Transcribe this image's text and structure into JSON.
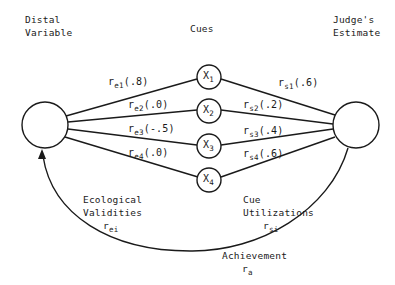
{
  "headers": {
    "distal": [
      "Distal",
      "Variable"
    ],
    "cues": "Cues",
    "judge": [
      "Judge's",
      "Estimate"
    ]
  },
  "cues": [
    {
      "name": "X",
      "sub": "1"
    },
    {
      "name": "X",
      "sub": "2"
    },
    {
      "name": "X",
      "sub": "3"
    },
    {
      "name": "X",
      "sub": "4"
    }
  ],
  "ecological_edges": [
    {
      "r": "r",
      "sub": "e1",
      "value": "(.8)"
    },
    {
      "r": "r",
      "sub": "e2",
      "value": "(.0)"
    },
    {
      "r": "r",
      "sub": "e3",
      "value": "(-.5)"
    },
    {
      "r": "r",
      "sub": "e4",
      "value": "(.0)"
    }
  ],
  "utilization_edges": [
    {
      "r": "r",
      "sub": "s1",
      "value": "(.6)"
    },
    {
      "r": "r",
      "sub": "s2",
      "value": "(.2)"
    },
    {
      "r": "r",
      "sub": "s3",
      "value": "(.4)"
    },
    {
      "r": "r",
      "sub": "s4",
      "value": "(.6)"
    }
  ],
  "ecological_validities": {
    "line1": "Ecological",
    "line2": "Validities",
    "r": "r",
    "sub": "ei"
  },
  "cue_utilizations": {
    "line1": "Cue",
    "line2": "Utilizations",
    "r": "r",
    "sub": "si"
  },
  "achievement": {
    "label": "Achievement",
    "r": "r",
    "sub": "a"
  },
  "colors": {
    "stroke": "#1a1a1a",
    "background": "#ffffff"
  }
}
